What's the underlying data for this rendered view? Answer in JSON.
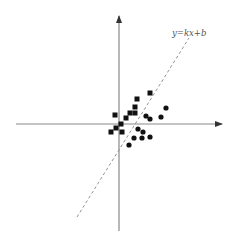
{
  "figure": {
    "type": "scatter-regression-diagram",
    "canvas": {
      "width": 240,
      "height": 241
    },
    "colors": {
      "axis": "#888888",
      "arrow": "#333333",
      "regression_line": "#888888",
      "marker": "#111111",
      "label": "#555555"
    },
    "axes": {
      "x_axis": {
        "x1": 16,
        "y1": 124,
        "x2": 222,
        "y2": 124,
        "arrow": "right"
      },
      "y_axis": {
        "x1": 119,
        "y1": 231,
        "x2": 119,
        "y2": 16,
        "arrow": "up"
      }
    },
    "regression_line": {
      "style": "dashed",
      "x1": 77,
      "y1": 217,
      "x2": 189,
      "y2": 38,
      "label": "y=kx+b",
      "label_pos": {
        "x": 172,
        "y": 36
      }
    },
    "series": [
      {
        "name": "squares",
        "marker": "square",
        "size": 5,
        "points": [
          {
            "x": 150,
            "y": 93
          },
          {
            "x": 137,
            "y": 99
          },
          {
            "x": 135,
            "y": 107
          },
          {
            "x": 130,
            "y": 113
          },
          {
            "x": 135,
            "y": 113
          },
          {
            "x": 115,
            "y": 115
          },
          {
            "x": 126,
            "y": 118
          },
          {
            "x": 121,
            "y": 124
          },
          {
            "x": 116,
            "y": 128
          },
          {
            "x": 111,
            "y": 132
          },
          {
            "x": 122,
            "y": 132
          }
        ]
      },
      {
        "name": "circles",
        "marker": "circle",
        "size": 2.6,
        "points": [
          {
            "x": 166,
            "y": 108
          },
          {
            "x": 146,
            "y": 116
          },
          {
            "x": 150,
            "y": 119
          },
          {
            "x": 161,
            "y": 117
          },
          {
            "x": 138,
            "y": 129
          },
          {
            "x": 143,
            "y": 132
          },
          {
            "x": 134,
            "y": 138
          },
          {
            "x": 142,
            "y": 138
          },
          {
            "x": 150,
            "y": 137
          },
          {
            "x": 129,
            "y": 145
          }
        ]
      }
    ]
  }
}
